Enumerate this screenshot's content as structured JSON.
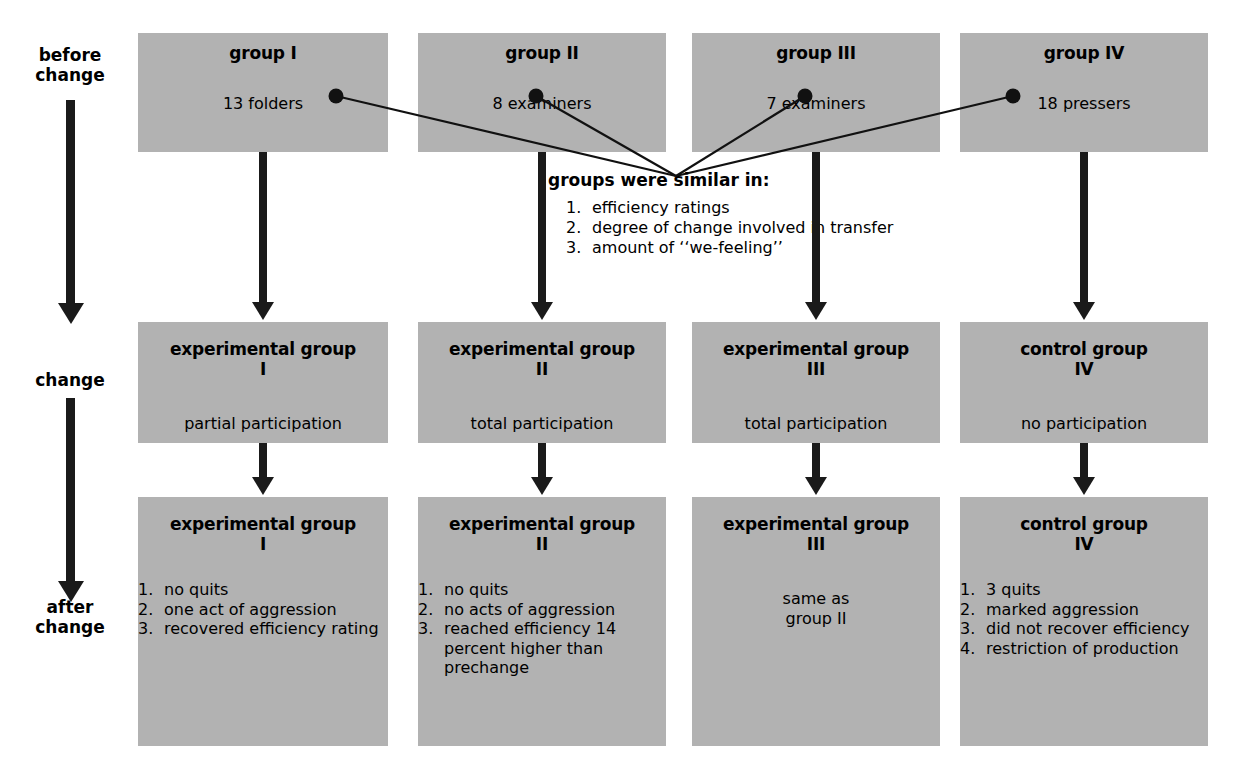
{
  "diagram": {
    "timeline": {
      "labels": [
        {
          "id": "before-change",
          "text": "before\nchange"
        },
        {
          "id": "change",
          "text": "change"
        },
        {
          "id": "after-change",
          "text": "after\nchange"
        }
      ]
    },
    "callout": {
      "title": "groups were similar in:",
      "items": [
        {
          "num": "1.",
          "text": "efficiency ratings"
        },
        {
          "num": "2.",
          "text": "degree of change involved in transfer"
        },
        {
          "num": "3.",
          "text": "amount of ‘‘we-feeling’’"
        }
      ]
    },
    "rows": {
      "before": [
        {
          "title": "group I",
          "sub": "13 folders"
        },
        {
          "title": "group II",
          "sub": "8 examiners"
        },
        {
          "title": "group III",
          "sub": "7 examiners"
        },
        {
          "title": "group IV",
          "sub": "18 pressers"
        }
      ],
      "change": [
        {
          "title": "experimental group",
          "numeral": "I",
          "sub": "partial participation"
        },
        {
          "title": "experimental group",
          "numeral": "II",
          "sub": "total participation"
        },
        {
          "title": "experimental group",
          "numeral": "III",
          "sub": "total participation"
        },
        {
          "title": "control group",
          "numeral": "IV",
          "sub": "no participation"
        }
      ],
      "after": [
        {
          "title": "experimental group",
          "numeral": "I",
          "items": [
            {
              "num": "1.",
              "text": "no quits"
            },
            {
              "num": "2.",
              "text": "one act of aggression"
            },
            {
              "num": "3.",
              "text": "recovered efficiency rating"
            }
          ]
        },
        {
          "title": "experimental group",
          "numeral": "II",
          "items": [
            {
              "num": "1.",
              "text": "no quits"
            },
            {
              "num": "2.",
              "text": "no acts of aggression"
            },
            {
              "num": "3.",
              "text": "reached efficiency 14 percent higher than prechange"
            }
          ]
        },
        {
          "title": "experimental group",
          "numeral": "III",
          "plain": "same as\ngroup II"
        },
        {
          "title": "control group",
          "numeral": "IV",
          "items": [
            {
              "num": "1.",
              "text": "3 quits"
            },
            {
              "num": "2.",
              "text": "marked aggression"
            },
            {
              "num": "3.",
              "text": "did not recover efficiency"
            },
            {
              "num": "4.",
              "text": "restriction of production"
            }
          ]
        }
      ]
    },
    "colors": {
      "box_fill": "#b2b2b2",
      "ink": "#000000",
      "arrow": "#1a1a1a",
      "page_background": "#ffffff"
    }
  }
}
